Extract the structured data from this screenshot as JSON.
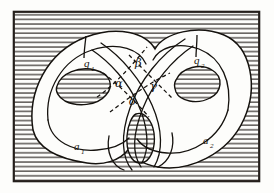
{
  "figure": {
    "kind": "line-drawing",
    "background": {
      "name": "horizontal-hatching",
      "line_color": "#2a2622",
      "paper_color": "#fdfdfb",
      "spacing_px": 4.6,
      "line_width_px": 1.1
    },
    "frame": {
      "name": "rectangular-border",
      "x": 13,
      "y": 11,
      "width": 247,
      "height": 171,
      "stroke": "#241f1b",
      "stroke_width": 2.2
    },
    "ink_color": "#15120e",
    "fill_color": "#fdfdfb"
  },
  "labels": {
    "q1": {
      "text": "q",
      "sub": "1",
      "x": 84,
      "y": 67
    },
    "q2": {
      "text": "q",
      "sub": "2",
      "x": 194,
      "y": 64
    },
    "a1": {
      "text": "a",
      "sub": "1",
      "x": 74,
      "y": 150
    },
    "a2": {
      "text": "a",
      "sub": "2",
      "x": 203,
      "y": 144
    },
    "alpha": {
      "text": "α",
      "x": 117,
      "y": 86
    },
    "beta": {
      "text": "β",
      "x": 138,
      "y": 66
    },
    "gamma": {
      "text": "γ",
      "x": 152,
      "y": 89
    },
    "delta": {
      "text": "δ",
      "x": 131,
      "y": 104
    }
  },
  "curves": {
    "outer_boundary": "M 33 130 C 27 92 47 52 86 37 C 118 25 146 33 155 49 C 164 33 197 24 224 35 C 252 47 258 88 244 119 C 228 155 188 172 158 167 C 141 164 132 157 128 150 C 120 160 104 166 87 163 C 60 159 38 150 33 130 Z",
    "inner_boundary": "M 52 118 C 49 88 65 60 93 50 C 118 41 139 49 146 62 C 154 49 179 40 201 50 C 224 60 230 93 219 116 C 206 145 175 157 152 153 C 139 151 132 145 129 140 C 122 148 109 152 96 150 C 74 147 56 140 52 118 Z",
    "left_hole": "M 57 85 C 62 72 80 66 95 70 C 110 74 113 86 106 95 C 98 105 78 107 66 101 C 58 97 55 91 57 85 Z",
    "right_hole": "M 176 79 C 182 66 201 63 212 70 C 223 77 222 92 211 98 C 198 105 180 101 176 92 C 174 87 174 82 176 79 Z",
    "center_hole": "M 134 116 C 141 111 151 116 154 129 C 157 145 152 163 142 165 C 131 167 125 152 126 137 C 127 126 130 119 134 116 Z",
    "handle_left_outer": "M 28 122 C 25 96 37 64 67 46",
    "handle_right_outer": "M 247 110 C 252 82 240 54 214 40",
    "loop_lower_left": "M 99 73 C 118 88 131 108 137 128 C 144 152 140 167 124 170",
    "loop_lower_right": "M 180 76 C 162 92 149 111 143 131 C 136 154 140 168 155 170"
  },
  "meridians": {
    "q1_segment": {
      "from": [
        86,
        37
      ],
      "to": [
        84,
        58
      ],
      "name": "meridian-q1"
    },
    "q2_segment": {
      "from": [
        197,
        36
      ],
      "to": [
        196,
        56
      ],
      "name": "meridian-q2"
    }
  },
  "dashed_curves": {
    "note": "dashed arcs bounding the four labelled regions alpha, beta, gamma, delta",
    "dash_pattern": "4,3",
    "arc_nw_se": "M 99 96 C 113 85 131 66 146 48",
    "arc_sw_ne": "M 110 110 C 124 99 144 82 166 72",
    "arc_cross_a": "M 104 74 C 120 86 136 102 150 118",
    "arc_cross_b": "M 128 56 C 142 70 158 86 172 100"
  }
}
